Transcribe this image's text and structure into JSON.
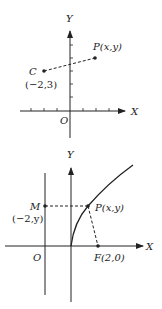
{
  "figure1": {
    "axis_x_label": "X",
    "axis_y_label": "Y",
    "origin_label": "O",
    "point_c": {
      "name": "C",
      "coords": "(−2,3)"
    },
    "point_p": {
      "name": "P(x,y)"
    }
  },
  "figure2": {
    "axis_x_label": "X",
    "axis_y_label": "Y",
    "origin_label": "O",
    "point_m": {
      "name": "M",
      "coords": "(−2,y)"
    },
    "point_p": {
      "name": "P(x,y)"
    },
    "point_f": {
      "name": "F(2,0)"
    }
  },
  "colors": {
    "ink": "#222222",
    "background": "#ffffff"
  }
}
